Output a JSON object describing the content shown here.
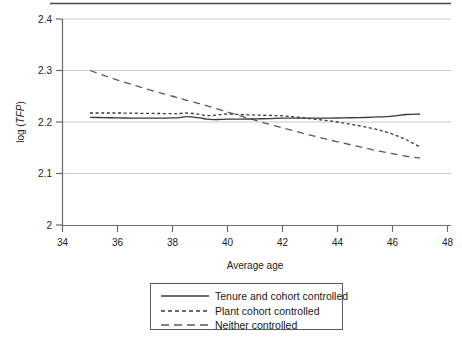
{
  "chart_data": {
    "type": "line",
    "title": "",
    "xlabel": "Average age",
    "ylabel": "log (TFP)",
    "ylabel_parts": {
      "prefix": "log (",
      "italic": "TFP",
      "suffix": ")"
    },
    "xlim": [
      34,
      48
    ],
    "ylim": [
      2.0,
      2.4
    ],
    "xticks": [
      34,
      36,
      38,
      40,
      42,
      44,
      46,
      48
    ],
    "xtick_labels": [
      "34",
      "36",
      "38",
      "40",
      "42",
      "44",
      "46",
      "48"
    ],
    "yticks": [
      2.0,
      2.1,
      2.2,
      2.3,
      2.4
    ],
    "ytick_labels": [
      "2",
      "2.1",
      "2.2",
      "2.3",
      "2.4"
    ],
    "grid": "horizontal",
    "legend_position": "below-plot",
    "x": [
      35,
      35.5,
      36,
      36.5,
      37,
      37.5,
      38,
      38.25,
      38.5,
      38.75,
      39,
      39.25,
      39.5,
      39.75,
      40,
      40.5,
      41,
      41.5,
      42,
      42.5,
      43,
      43.5,
      44,
      44.5,
      45,
      45.5,
      46,
      46.5,
      47
    ],
    "series": [
      {
        "name": "Tenure and cohort controlled",
        "style": "solid",
        "color": "#3a3a3a",
        "values": [
          2.209,
          2.2085,
          2.208,
          2.2075,
          2.2075,
          2.2075,
          2.208,
          2.2085,
          2.2105,
          2.2095,
          2.208,
          2.2055,
          2.2045,
          2.205,
          2.2055,
          2.2055,
          2.206,
          2.2065,
          2.2075,
          2.2075,
          2.2075,
          2.2075,
          2.2078,
          2.2082,
          2.2088,
          2.2098,
          2.2115,
          2.2145,
          2.2155
        ]
      },
      {
        "name": "Plant cohort controlled",
        "style": "dotted",
        "color": "#3a3a3a",
        "values": [
          2.2175,
          2.2175,
          2.2175,
          2.2172,
          2.2168,
          2.2165,
          2.2162,
          2.2165,
          2.2175,
          2.2165,
          2.2145,
          2.2125,
          2.2128,
          2.2145,
          2.2155,
          2.2145,
          2.2135,
          2.2128,
          2.212,
          2.2095,
          2.2065,
          2.2035,
          2.2,
          2.1955,
          2.1905,
          2.1845,
          2.1765,
          2.1655,
          2.1515
        ]
      },
      {
        "name": "Neither controlled",
        "style": "dashed",
        "color": "#5a5a5a",
        "values": [
          2.3,
          2.2905,
          2.2815,
          2.273,
          2.265,
          2.2575,
          2.25,
          2.2465,
          2.2425,
          2.239,
          2.2355,
          2.2315,
          2.2275,
          2.2235,
          2.2195,
          2.2115,
          2.2035,
          2.196,
          2.1885,
          2.1815,
          2.1745,
          2.168,
          2.1615,
          2.1555,
          2.1495,
          2.1435,
          2.1385,
          2.1335,
          2.13
        ]
      }
    ],
    "legend_entries": [
      {
        "label": "Tenure and cohort controlled",
        "style": "solid"
      },
      {
        "label": "Plant cohort controlled",
        "style": "dotted"
      },
      {
        "label": "Neither controlled",
        "style": "dashed"
      }
    ]
  }
}
